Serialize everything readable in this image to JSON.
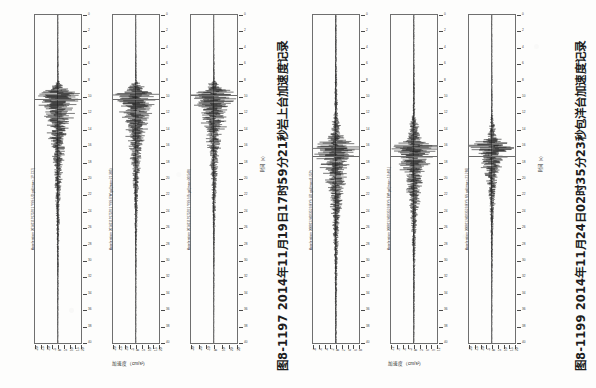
{
  "page": {
    "background_color": "#fdfdfc",
    "ink_color": "#1d1d1d",
    "document_type": "scanned-book-page"
  },
  "figures": [
    {
      "id": "figure-left",
      "caption": "图8-1197  2014年11月19日17时59分21秒岩上台加速度记录",
      "caption_number": "图8-1197",
      "caption_date": "2014年11月19日17时59分21秒",
      "station": "岩上台",
      "record_type": "加速度记录",
      "time_axis_label": "时间（s）",
      "amplitude_axis_label": "加速度（cm/s²）",
      "panels": [
        {
          "series_label": "Acceleration 20141119175921 YSS UD gal(max=-19.727)",
          "component": "UD",
          "peak_value": "-19.727",
          "units": "gal",
          "time_ticks": [
            "0",
            "2",
            "4",
            "6",
            "8",
            "10",
            "12",
            "14",
            "16",
            "18",
            "20",
            "22",
            "24",
            "26",
            "28",
            "30",
            "32",
            "34",
            "36",
            "38",
            "40"
          ],
          "amplitude_ticks": [
            "-20",
            "-15",
            "-10",
            "-5",
            "0",
            "5",
            "10",
            "15",
            "20"
          ]
        },
        {
          "series_label": "Acceleration 20141119175921 YSS EW gal(max=21.385)",
          "component": "EW",
          "peak_value": "21.385",
          "units": "gal",
          "time_ticks": [
            "0",
            "2",
            "4",
            "6",
            "8",
            "10",
            "12",
            "14",
            "16",
            "18",
            "20",
            "22",
            "24",
            "26",
            "28",
            "30",
            "32",
            "34",
            "36",
            "38",
            "40"
          ],
          "amplitude_ticks": [
            "-20",
            "-15",
            "-10",
            "-5",
            "0",
            "5",
            "10",
            "15",
            "20"
          ]
        },
        {
          "series_label": "Acceleration 20141119175921 YSS NS gal(max=30.548)",
          "component": "NS",
          "peak_value": "30.548",
          "units": "gal",
          "time_ticks": [
            "0",
            "2",
            "4",
            "6",
            "8",
            "10",
            "12",
            "14",
            "16",
            "18",
            "20",
            "22",
            "24",
            "26",
            "28",
            "30",
            "32",
            "34",
            "36",
            "38",
            "40"
          ],
          "amplitude_ticks": [
            "-30",
            "-20",
            "-10",
            "0",
            "10",
            "20",
            "30"
          ]
        }
      ]
    },
    {
      "id": "figure-right",
      "caption": "图8-1199  2014年11月24日02时35分23秒包洋台加速度记录",
      "caption_number": "图8-1199",
      "caption_date": "2014年11月24日02时35分23秒",
      "station": "包洋台",
      "record_type": "加速度记录",
      "time_axis_label": "时间（s）",
      "amplitude_axis_label": "加速度（cm/s²）",
      "panels": [
        {
          "series_label": "Acceleration 20081124023523 BYS UD gal(max=8.259)",
          "component": "UD",
          "peak_value": "8.259",
          "units": "gal",
          "time_ticks": [
            "0",
            "2",
            "4",
            "6",
            "8",
            "10",
            "12",
            "14",
            "16",
            "18",
            "20",
            "22",
            "24",
            "26",
            "28",
            "30",
            "32",
            "34",
            "36",
            "38",
            "40"
          ],
          "amplitude_ticks": [
            "-8",
            "-6",
            "-4",
            "-2",
            "0",
            "2",
            "4",
            "6",
            "8"
          ]
        },
        {
          "series_label": "Acceleration 20081124023523 BYS EW gal(max=-13.461)",
          "component": "EW",
          "peak_value": "-13.461",
          "units": "gal",
          "time_ticks": [
            "0",
            "2",
            "4",
            "6",
            "8",
            "10",
            "12",
            "14",
            "16",
            "18",
            "20",
            "22",
            "24",
            "26",
            "28",
            "30",
            "32",
            "34",
            "36",
            "38",
            "40"
          ],
          "amplitude_ticks": [
            "-12",
            "-9",
            "-6",
            "-3",
            "0",
            "3",
            "6",
            "9",
            "12"
          ]
        },
        {
          "series_label": "Acceleration 20081124023523 BYS NS gal(max=-21.286)",
          "component": "NS",
          "peak_value": "-21.286",
          "units": "gal",
          "time_ticks": [
            "0",
            "2",
            "4",
            "6",
            "8",
            "10",
            "12",
            "14",
            "16",
            "18",
            "20",
            "22",
            "24",
            "26",
            "28",
            "30",
            "32",
            "34",
            "36",
            "38",
            "40"
          ],
          "amplitude_ticks": [
            "-20",
            "-15",
            "-10",
            "-5",
            "0",
            "5",
            "10",
            "15",
            "20"
          ]
        }
      ]
    }
  ],
  "chart_data": [
    {
      "type": "line",
      "title": "图8-1197  2014年11月19日17时59分21秒岩上台加速度记录",
      "xlabel": "时间（s）",
      "ylabel": "加速度（cm/s²）",
      "xlim": [
        0,
        40
      ],
      "grid": false,
      "legend": "none",
      "orientation": "vertical-time-axis",
      "series": [
        {
          "name": "Acceleration 20141119175921 YSS UD gal(max=-19.727)",
          "component": "UD",
          "ylim": [
            -20,
            20
          ],
          "peak_amplitude": -19.727,
          "onset_time_s": 9.0,
          "coda_end_time_s": 26.0,
          "envelope_times": [
            0,
            4,
            8,
            9,
            9.6,
            10.4,
            11.5,
            13,
            15,
            17,
            19,
            21,
            24,
            28,
            32,
            36,
            40
          ],
          "envelope_amplitudes": [
            0.2,
            0.3,
            0.6,
            6.0,
            19.7,
            14.0,
            11.0,
            8.5,
            6.0,
            4.2,
            3.0,
            2.2,
            1.4,
            0.8,
            0.5,
            0.3,
            0.2
          ]
        },
        {
          "name": "Acceleration 20141119175921 YSS EW gal(max=21.385)",
          "component": "EW",
          "ylim": [
            -22,
            22
          ],
          "peak_amplitude": 21.385,
          "onset_time_s": 9.0,
          "coda_end_time_s": 25.0,
          "envelope_times": [
            0,
            4,
            8,
            9,
            9.8,
            10.6,
            11.8,
            13,
            15,
            17,
            19,
            21,
            24,
            28,
            32,
            36,
            40
          ],
          "envelope_amplitudes": [
            0.2,
            0.3,
            0.7,
            7.0,
            21.4,
            16.0,
            12.0,
            9.0,
            6.5,
            4.5,
            3.2,
            2.3,
            1.3,
            0.7,
            0.4,
            0.3,
            0.2
          ]
        },
        {
          "name": "Acceleration 20141119175921 YSS NS gal(max=30.548)",
          "component": "NS",
          "ylim": [
            -32,
            32
          ],
          "peak_amplitude": 30.548,
          "onset_time_s": 8.6,
          "coda_end_time_s": 27.0,
          "envelope_times": [
            0,
            4,
            8,
            8.8,
            9.6,
            10.6,
            12,
            13.5,
            15.5,
            17.5,
            19.5,
            22,
            25,
            29,
            33,
            37,
            40
          ],
          "envelope_amplitudes": [
            0.2,
            0.4,
            0.9,
            10.0,
            30.5,
            22.0,
            16.0,
            12.0,
            8.0,
            5.5,
            3.8,
            2.6,
            1.5,
            0.8,
            0.5,
            0.3,
            0.2
          ]
        }
      ]
    },
    {
      "type": "line",
      "title": "图8-1199  2014年11月24日02时35分23秒包洋台加速度记录",
      "xlabel": "时间（s）",
      "ylabel": "加速度（cm/s²）",
      "xlim": [
        0,
        40
      ],
      "grid": false,
      "legend": "none",
      "orientation": "vertical-time-axis",
      "series": [
        {
          "name": "Acceleration 20081124023523 BYS UD gal(max=8.259)",
          "component": "UD",
          "ylim": [
            -9,
            9
          ],
          "peak_amplitude": 8.259,
          "onset_time_s": 16.0,
          "coda_end_time_s": 28.0,
          "envelope_times": [
            0,
            6,
            12,
            15,
            16,
            17,
            18.5,
            20,
            22,
            24,
            26,
            29,
            32,
            36,
            40
          ],
          "envelope_amplitudes": [
            0.2,
            0.3,
            0.6,
            2.5,
            8.3,
            6.0,
            4.5,
            3.2,
            2.2,
            1.5,
            1.0,
            0.6,
            0.4,
            0.3,
            0.2
          ]
        },
        {
          "name": "Acceleration 20081124023523 BYS EW gal(max=-13.461)",
          "component": "EW",
          "ylim": [
            -14,
            14
          ],
          "peak_amplitude": -13.461,
          "onset_time_s": 16.0,
          "coda_end_time_s": 29.0,
          "envelope_times": [
            0,
            6,
            12,
            15,
            16,
            17,
            18.5,
            20,
            22,
            24,
            26,
            29,
            32,
            36,
            40
          ],
          "envelope_amplitudes": [
            0.2,
            0.3,
            0.7,
            3.5,
            13.5,
            9.0,
            6.5,
            4.5,
            3.0,
            2.0,
            1.3,
            0.8,
            0.5,
            0.3,
            0.2
          ]
        },
        {
          "name": "Acceleration 20081124023523 BYS NS gal(max=-21.286)",
          "component": "NS",
          "ylim": [
            -22,
            22
          ],
          "peak_amplitude": -21.286,
          "onset_time_s": 16.0,
          "coda_end_time_s": 27.0,
          "envelope_times": [
            0,
            6,
            12,
            15,
            16,
            17,
            18.2,
            19.5,
            21,
            23,
            25,
            28,
            32,
            36,
            40
          ],
          "envelope_amplitudes": [
            0.2,
            0.3,
            0.6,
            4.0,
            21.3,
            12.0,
            8.0,
            5.5,
            3.5,
            2.2,
            1.4,
            0.8,
            0.4,
            0.3,
            0.2
          ]
        }
      ]
    }
  ]
}
